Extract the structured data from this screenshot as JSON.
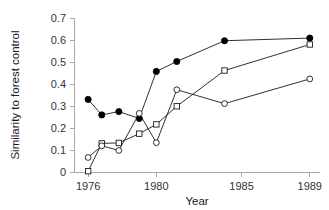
{
  "chart_data": {
    "type": "line",
    "title": "",
    "subtitle": "",
    "xlabel": "Year",
    "ylabel": "Similarity to forest control",
    "xlim": [
      1975.2,
      1989.6
    ],
    "ylim": [
      0,
      0.7
    ],
    "grid": false,
    "legend": "none",
    "x_ticks": [
      1976,
      1980,
      1985,
      1989
    ],
    "x_tick_labels": [
      "1976",
      "1980",
      "1985",
      "1989"
    ],
    "y_ticks": [
      0,
      0.1,
      0.2,
      0.3,
      0.4,
      0.5,
      0.6,
      0.7
    ],
    "y_tick_labels": [
      "0",
      "0.1",
      "0.2",
      "0.3",
      "0.4",
      "0.5",
      "0.6",
      "0.7"
    ],
    "series": [
      {
        "name": "filled-circle-series",
        "marker": "filled-circle",
        "x": [
          1976,
          1976.8,
          1977.8,
          1979,
          1980,
          1981.2,
          1984,
          1989
        ],
        "values": [
          0.331,
          0.261,
          0.276,
          0.245,
          0.458,
          0.503,
          0.597,
          0.609
        ]
      },
      {
        "name": "open-square-series",
        "marker": "open-square",
        "x": [
          1976,
          1976.8,
          1977.8,
          1979,
          1980,
          1981.2,
          1984,
          1989
        ],
        "values": [
          0.006,
          0.132,
          0.134,
          0.176,
          0.218,
          0.3,
          0.462,
          0.58
        ]
      },
      {
        "name": "open-circle-series",
        "marker": "open-circle",
        "x": [
          1976,
          1976.8,
          1977.8,
          1979,
          1980,
          1981.2,
          1984,
          1989
        ],
        "values": [
          0.068,
          0.121,
          0.1,
          0.268,
          0.135,
          0.375,
          0.312,
          0.424
        ]
      }
    ]
  },
  "colors": {
    "background": "#ffffff",
    "axis": "#a8a8a8",
    "line": "#1a1a1a",
    "marker_fill_open": "#ffffff",
    "marker_fill_solid": "#000000",
    "text": "#222222"
  }
}
